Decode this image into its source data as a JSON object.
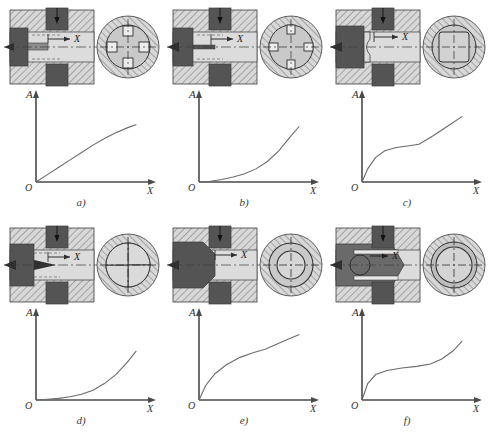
{
  "figure": {
    "axis_labels": {
      "y": "A",
      "x": "X",
      "origin": "O",
      "stroke": "X"
    },
    "colors": {
      "hatch_line": "#6f6f6f",
      "hatch_bg": "#d8d8d8",
      "dark_part": "#545454",
      "mid_part": "#8c8c8c",
      "light_chamber": "#dcdcdc",
      "curve": "#6b6b6b",
      "axis": "#4a4a4a",
      "outline": "#3c3c3c"
    },
    "panels": [
      {
        "id": "a",
        "label": "a)",
        "stroke_label": "X",
        "port_shape": "four-square-ports",
        "section_note": "round bore with four square orifices",
        "chart_data": {
          "type": "line",
          "title": "",
          "xlabel": "X",
          "ylabel": "A",
          "xlim": [
            0,
            1
          ],
          "ylim": [
            0,
            1
          ],
          "grid": false,
          "legend": "none",
          "x": [
            0.0,
            0.1,
            0.2,
            0.3,
            0.4,
            0.5,
            0.6,
            0.7,
            0.8,
            0.88
          ],
          "y": [
            0.0,
            0.09,
            0.18,
            0.27,
            0.36,
            0.45,
            0.53,
            0.6,
            0.66,
            0.7
          ]
        }
      },
      {
        "id": "b",
        "label": "b)",
        "stroke_label": "X",
        "port_shape": "four-square-ports-narrow",
        "section_note": "round bore with four square orifices, narrow stem",
        "chart_data": {
          "type": "line",
          "title": "",
          "xlabel": "X",
          "ylabel": "A",
          "xlim": [
            0,
            1
          ],
          "ylim": [
            0,
            1
          ],
          "grid": false,
          "legend": "none",
          "x": [
            0.0,
            0.1,
            0.2,
            0.3,
            0.4,
            0.5,
            0.6,
            0.7,
            0.8,
            0.88
          ],
          "y": [
            0.0,
            0.01,
            0.03,
            0.06,
            0.1,
            0.16,
            0.25,
            0.38,
            0.55,
            0.68
          ]
        }
      },
      {
        "id": "c",
        "label": "c)",
        "stroke_label": "X",
        "port_shape": "rounded-square-port",
        "section_note": "round bore with square window",
        "chart_data": {
          "type": "line",
          "title": "",
          "xlabel": "X",
          "ylabel": "A",
          "xlim": [
            0,
            1
          ],
          "ylim": [
            0,
            1
          ],
          "grid": false,
          "legend": "none",
          "x": [
            0.0,
            0.05,
            0.12,
            0.2,
            0.3,
            0.4,
            0.5,
            0.62,
            0.75,
            0.88
          ],
          "y": [
            0.0,
            0.16,
            0.3,
            0.38,
            0.42,
            0.44,
            0.46,
            0.56,
            0.68,
            0.8
          ]
        }
      },
      {
        "id": "d",
        "label": "d)",
        "stroke_label": "X",
        "port_shape": "four-lobe-ports",
        "section_note": "round bore with four rounded lobes, conical needle",
        "chart_data": {
          "type": "line",
          "title": "",
          "xlabel": "X",
          "ylabel": "A",
          "xlim": [
            0,
            1
          ],
          "ylim": [
            0,
            1
          ],
          "grid": false,
          "legend": "none",
          "x": [
            0.0,
            0.1,
            0.2,
            0.3,
            0.4,
            0.5,
            0.6,
            0.7,
            0.8,
            0.88
          ],
          "y": [
            0.0,
            0.01,
            0.02,
            0.04,
            0.07,
            0.12,
            0.2,
            0.31,
            0.46,
            0.6
          ]
        }
      },
      {
        "id": "e",
        "label": "e)",
        "stroke_label": "X",
        "port_shape": "concentric-annulus",
        "section_note": "round bore with concentric annular gap, chamfered plunger",
        "chart_data": {
          "type": "line",
          "title": "",
          "xlabel": "X",
          "ylabel": "A",
          "xlim": [
            0,
            1
          ],
          "ylim": [
            0,
            1
          ],
          "grid": false,
          "legend": "none",
          "x": [
            0.0,
            0.06,
            0.14,
            0.24,
            0.36,
            0.48,
            0.58,
            0.68,
            0.78,
            0.88
          ],
          "y": [
            0.0,
            0.18,
            0.32,
            0.43,
            0.52,
            0.58,
            0.62,
            0.68,
            0.74,
            0.8
          ]
        }
      },
      {
        "id": "f",
        "label": "f)",
        "stroke_label": "X",
        "port_shape": "circular-bore-spool",
        "section_note": "round bore with circular cross-drilling in spool",
        "chart_data": {
          "type": "line",
          "title": "",
          "xlabel": "X",
          "ylabel": "A",
          "xlim": [
            0,
            1
          ],
          "ylim": [
            0,
            1
          ],
          "grid": false,
          "legend": "none",
          "x": [
            0.0,
            0.05,
            0.12,
            0.22,
            0.35,
            0.48,
            0.6,
            0.7,
            0.8,
            0.88
          ],
          "y": [
            0.0,
            0.2,
            0.31,
            0.36,
            0.39,
            0.41,
            0.44,
            0.5,
            0.6,
            0.72
          ]
        }
      }
    ]
  }
}
